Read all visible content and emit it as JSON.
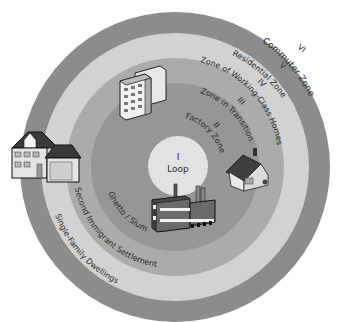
{
  "center": {
    "x": 175,
    "y": 167
  },
  "colors": {
    "background": "#ffffff",
    "zone_v": "#8c8c8c",
    "zone_iv": "#d2d2d2",
    "zone_iii": "#ababab",
    "zone_ii": "#969696",
    "zone_i": "#e2e2e2",
    "text": "#2a2a2a"
  },
  "zones": [
    {
      "numeral": "I",
      "name": "Loop",
      "radius": 30
    },
    {
      "numeral": "II",
      "name": "Factory Zone",
      "radius": 58
    },
    {
      "numeral": "III",
      "name": "Zone in Transition",
      "sublabel": "Ghetto / Slum",
      "radius": 84
    },
    {
      "numeral": "IV",
      "name": "Zone of Working-Class Homes",
      "sublabel": "Second Immigrant Settlement",
      "radius": 109
    },
    {
      "numeral": "V",
      "name": "Residential Zone",
      "sublabel": "Single-Family Dwellings",
      "radius": 155
    },
    {
      "numeral": "VI",
      "name": "Commuter Zone"
    }
  ],
  "icons": [
    {
      "name": "apartment-building-icon",
      "zone": "IV"
    },
    {
      "name": "factory-icon",
      "zone": "I"
    },
    {
      "name": "cottage-icon",
      "zone": "III"
    },
    {
      "name": "suburban-house-icon",
      "zone": "V"
    }
  ]
}
